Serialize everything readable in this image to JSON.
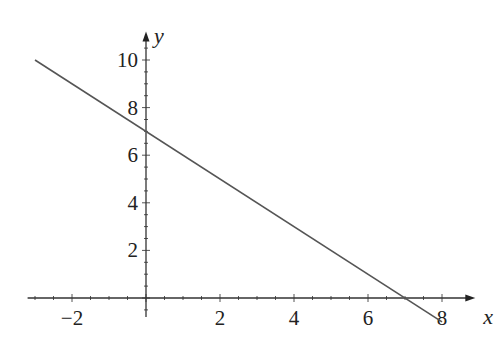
{
  "chart_data": {
    "type": "line",
    "title": "",
    "xlabel": "x",
    "ylabel": "y",
    "xlim": [
      -3.2,
      8.9
    ],
    "ylim": [
      -0.8,
      11.2
    ],
    "x_ticks": [
      -2,
      2,
      4,
      6,
      8
    ],
    "y_ticks": [
      2,
      4,
      6,
      8,
      10
    ],
    "x_minor_step": 0.5,
    "y_minor_step": 0.5,
    "grid": false,
    "series": [
      {
        "name": "y = 7 - x",
        "x": [
          -3,
          8
        ],
        "y": [
          10,
          -1
        ],
        "color": "#555555"
      }
    ]
  }
}
